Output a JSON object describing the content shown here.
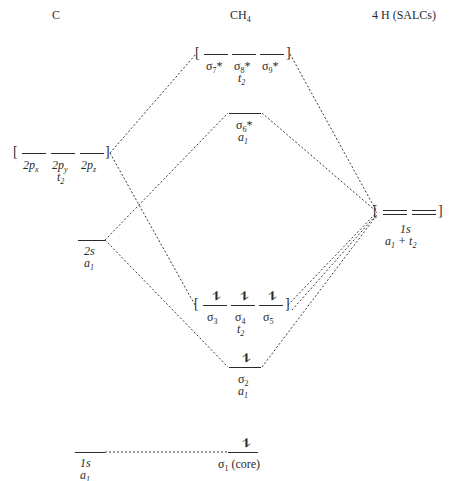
{
  "headers": {
    "left": "C",
    "center": "CH4",
    "right": "4 H (SALCs)"
  },
  "carbon": {
    "p": {
      "labels": [
        "2p_x",
        "2p_y",
        "2p_z"
      ],
      "symmetry": "t2"
    },
    "s2": {
      "label": "2s",
      "symmetry": "a1"
    },
    "s1": {
      "label": "1s",
      "symmetry": "a1"
    }
  },
  "ch4": {
    "sigma789": {
      "labels": [
        "σ7*",
        "σ8*",
        "σ9*"
      ],
      "symmetry": "t2",
      "electrons": 0
    },
    "sigma6": {
      "label": "σ6*",
      "symmetry": "a1",
      "electrons": 0
    },
    "sigma345": {
      "labels": [
        "σ3",
        "σ4",
        "σ5"
      ],
      "symmetry": "t2",
      "electrons": 2
    },
    "sigma2": {
      "label": "σ2",
      "symmetry": "a1",
      "electrons": 2
    },
    "sigma1": {
      "label": "σ1 (core)",
      "electrons": 2
    }
  },
  "hydrogen": {
    "label": "1s",
    "symmetry": "a1 + t2"
  },
  "glyphs": {
    "pair": "⥮",
    "open": "[",
    "close": "]"
  }
}
